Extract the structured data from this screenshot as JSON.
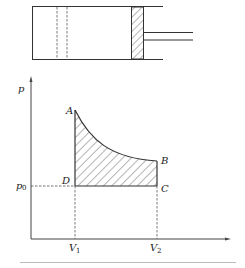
{
  "diagram": {
    "type": "piston cylinder and p-V diagram",
    "colors": {
      "line": "#333333",
      "dash": "#555555",
      "hatch": "#444444",
      "separator": "#bbbbbb",
      "background": "#ffffff"
    },
    "cylinder": {
      "label": "cylinder",
      "piston_label": "piston (hatched)",
      "rod_label": "piston rod"
    },
    "graph": {
      "y_axis_label": "p",
      "x_axis_label": "",
      "points": {
        "A": "A",
        "B": "B",
        "C": "C",
        "D": "D"
      },
      "p0_main": "p",
      "p0_sub": "0",
      "v1_main": "V",
      "v1_sub": "1",
      "v2_main": "V",
      "v2_sub": "2"
    }
  }
}
